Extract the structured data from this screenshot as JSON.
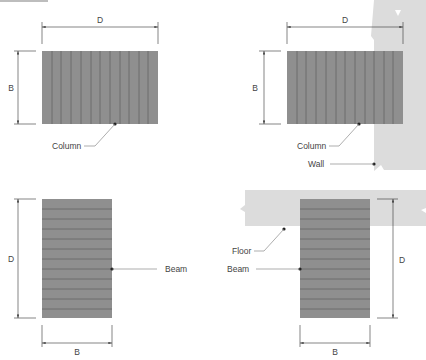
{
  "colors": {
    "member_fill": "#8f8f8f",
    "grain_line": "#6a6a6a",
    "context_fill": "#dcdcdc",
    "dim_line": "#333333",
    "leader": "#777777",
    "text": "#444444"
  },
  "header_bar": {
    "visible": true
  },
  "panels": [
    {
      "id": "column-freestanding",
      "dims": {
        "width": "D",
        "height": "B"
      },
      "callouts": [
        {
          "label": "Column"
        }
      ]
    },
    {
      "id": "column-against-wall",
      "dims": {
        "width": "D",
        "height": "B"
      },
      "callouts": [
        {
          "label": "Column"
        },
        {
          "label": "Wall"
        }
      ]
    },
    {
      "id": "beam-freestanding",
      "dims": {
        "height": "D",
        "width": "B"
      },
      "callouts": [
        {
          "label": "Beam"
        }
      ]
    },
    {
      "id": "beam-under-floor",
      "dims": {
        "height": "D",
        "width": "B"
      },
      "callouts": [
        {
          "label": "Floor"
        },
        {
          "label": "Beam"
        }
      ]
    }
  ]
}
